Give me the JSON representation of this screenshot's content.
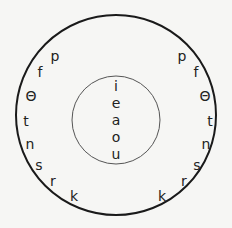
{
  "outer_circle": {
    "cx": 116,
    "cy": 115,
    "r": 100,
    "stroke": "#1a1a1a"
  },
  "inner_circle": {
    "cx": 116,
    "cy": 120,
    "r": 44,
    "stroke": "#555555"
  },
  "vowels": [
    {
      "ch": "i",
      "x": 116,
      "y": 87
    },
    {
      "ch": "e",
      "x": 116,
      "y": 104
    },
    {
      "ch": "a",
      "x": 116,
      "y": 121
    },
    {
      "ch": "o",
      "x": 116,
      "y": 138
    },
    {
      "ch": "u",
      "x": 116,
      "y": 155
    }
  ],
  "left_consonants": [
    {
      "ch": "p",
      "x": 55,
      "y": 57
    },
    {
      "ch": "f",
      "x": 40,
      "y": 73
    },
    {
      "ch": "Θ",
      "x": 31,
      "y": 97
    },
    {
      "ch": "t",
      "x": 26,
      "y": 122
    },
    {
      "ch": "n",
      "x": 30,
      "y": 145
    },
    {
      "ch": "s",
      "x": 39,
      "y": 166
    },
    {
      "ch": "r",
      "x": 53,
      "y": 182
    },
    {
      "ch": "k",
      "x": 74,
      "y": 197
    }
  ],
  "right_consonants": [
    {
      "ch": "p",
      "x": 182,
      "y": 57
    },
    {
      "ch": "f",
      "x": 196,
      "y": 73
    },
    {
      "ch": "Θ",
      "x": 205,
      "y": 97
    },
    {
      "ch": "t",
      "x": 210,
      "y": 122
    },
    {
      "ch": "n",
      "x": 206,
      "y": 145
    },
    {
      "ch": "s",
      "x": 197,
      "y": 166
    },
    {
      "ch": "r",
      "x": 184,
      "y": 182
    },
    {
      "ch": "k",
      "x": 162,
      "y": 197
    }
  ]
}
